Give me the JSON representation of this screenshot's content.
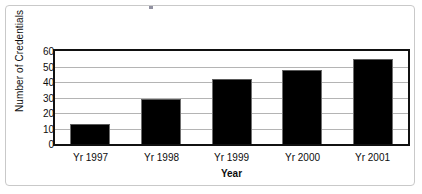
{
  "chart_data": {
    "type": "bar",
    "title": "",
    "subtitle": "",
    "xlabel": "Year",
    "ylabel": "Number of Credentials",
    "categories": [
      "Yr 1997",
      "Yr 1998",
      "Yr 1999",
      "Yr 2000",
      "Yr 2001"
    ],
    "values": [
      13,
      29,
      42,
      48,
      55
    ],
    "series": [
      {
        "name": "Number of Credentials",
        "values": [
          13,
          29,
          42,
          48,
          55
        ]
      }
    ],
    "ylim": [
      0,
      60
    ],
    "ytick_labels": [
      "60",
      "50",
      "40",
      "30",
      "20",
      "10",
      "0"
    ],
    "ytick_values": [
      60,
      50,
      40,
      30,
      20,
      10,
      0
    ],
    "ytick_interval": 10,
    "grid": "horizontal",
    "legend": "none",
    "bar_color": "#000000",
    "gridline_color": "#b4b4b4",
    "axis_color": "#111111",
    "frame_color": "#c9c9c9",
    "text_color": "#0d0d0d"
  }
}
